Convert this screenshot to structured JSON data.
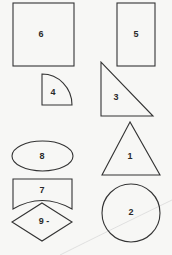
{
  "colors": {
    "background": "#f7f7f5",
    "stroke": "#333333",
    "label": "#2a2a2a"
  },
  "shapes": [
    {
      "id": "1",
      "label": "1",
      "type": "triangle"
    },
    {
      "id": "2",
      "label": "2",
      "type": "circle"
    },
    {
      "id": "3",
      "label": "3",
      "type": "right-triangle"
    },
    {
      "id": "4",
      "label": "4",
      "type": "quarter-circle"
    },
    {
      "id": "5",
      "label": "5",
      "type": "rectangle"
    },
    {
      "id": "6",
      "label": "6",
      "type": "square"
    },
    {
      "id": "7",
      "label": "7",
      "type": "concave-rectangle"
    },
    {
      "id": "8",
      "label": "8",
      "type": "ellipse"
    },
    {
      "id": "9",
      "label": "9 -",
      "type": "rhombus"
    }
  ]
}
